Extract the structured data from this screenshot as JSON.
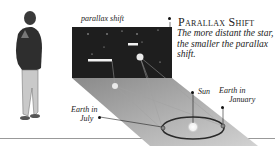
{
  "diagram": {
    "title": "Parallax Shift",
    "subtitle": "The more distant the star, the smaller the parallax shift.",
    "labels": {
      "parallax_shift": "parallax shift",
      "sun": "Sun",
      "earth_january_line1": "Earth in",
      "earth_january_line2": "January",
      "earth_july_line1": "Earth in",
      "earth_july_line2": "July"
    },
    "colors": {
      "star_field": "#1e1e1e",
      "projection_plane": "#b0b0b0",
      "orbit": "#2a2a2a",
      "ground_line": "#999999"
    },
    "icons": {
      "observer": "person-standing-icon",
      "sun": "sun-glow-icon"
    }
  }
}
